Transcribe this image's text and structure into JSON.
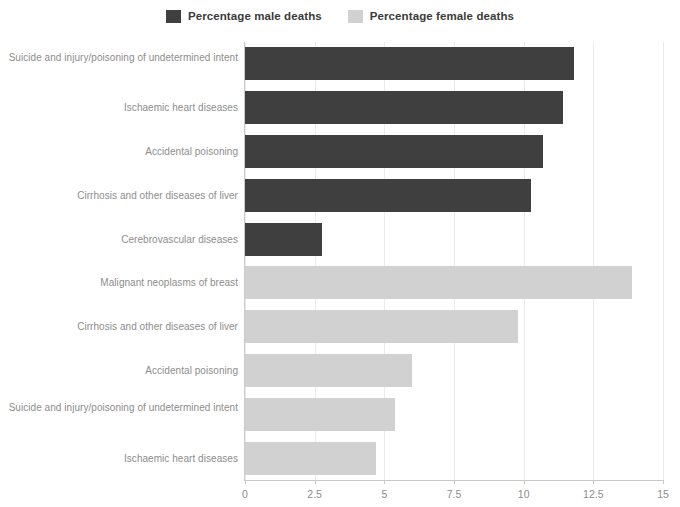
{
  "legend": {
    "entries": [
      {
        "label": "Percentage male deaths",
        "color": "#3f3f3f",
        "key": "male"
      },
      {
        "label": "Percentage female deaths",
        "color": "#d1d1d1",
        "key": "female"
      }
    ]
  },
  "axis": {
    "x_ticks": [
      "0",
      "2.5",
      "5",
      "7.5",
      "10",
      "12.5",
      "15"
    ]
  },
  "categories": [
    "Suicide and injury/poisoning of undetermined intent",
    "Ischaemic heart diseases",
    "Accidental poisoning",
    "Cirrhosis and other diseases of liver",
    "Cerebrovascular diseases",
    "Malignant neoplasms of breast",
    "Cirrhosis and other diseases of liver",
    "Accidental poisoning",
    "Suicide and injury/poisoning of undetermined intent",
    "Ischaemic heart diseases"
  ],
  "chart_data": {
    "type": "bar",
    "orientation": "horizontal",
    "title": "",
    "xlabel": "",
    "ylabel": "",
    "xlim": [
      0,
      15
    ],
    "xticks": [
      0,
      2.5,
      5,
      7.5,
      10,
      12.5,
      15
    ],
    "grid": true,
    "legend_position": "top-center",
    "categories": [
      "Suicide and injury/poisoning of undetermined intent",
      "Ischaemic heart diseases",
      "Accidental poisoning",
      "Cirrhosis and other diseases of liver",
      "Cerebrovascular diseases",
      "Malignant neoplasms of breast",
      "Cirrhosis and other diseases of liver",
      "Accidental poisoning",
      "Suicide and injury/poisoning of undetermined intent",
      "Ischaemic heart diseases"
    ],
    "series": [
      {
        "name": "Percentage male deaths",
        "color": "#3f3f3f",
        "values": [
          11.8,
          11.4,
          10.7,
          10.25,
          2.75,
          null,
          null,
          null,
          null,
          null
        ]
      },
      {
        "name": "Percentage female deaths",
        "color": "#d1d1d1",
        "values": [
          null,
          null,
          null,
          null,
          null,
          13.9,
          9.8,
          6.0,
          5.4,
          4.7
        ]
      }
    ],
    "bars": [
      {
        "category": "Suicide and injury/poisoning of undetermined intent",
        "series": "Percentage male deaths",
        "value": 11.8
      },
      {
        "category": "Ischaemic heart diseases",
        "series": "Percentage male deaths",
        "value": 11.4
      },
      {
        "category": "Accidental poisoning",
        "series": "Percentage male deaths",
        "value": 10.7
      },
      {
        "category": "Cirrhosis and other diseases of liver",
        "series": "Percentage male deaths",
        "value": 10.25
      },
      {
        "category": "Cerebrovascular diseases",
        "series": "Percentage male deaths",
        "value": 2.75
      },
      {
        "category": "Malignant neoplasms of breast",
        "series": "Percentage female deaths",
        "value": 13.9
      },
      {
        "category": "Cirrhosis and other diseases of liver",
        "series": "Percentage female deaths",
        "value": 9.8
      },
      {
        "category": "Accidental poisoning",
        "series": "Percentage female deaths",
        "value": 6.0
      },
      {
        "category": "Suicide and injury/poisoning of undetermined intent",
        "series": "Percentage female deaths",
        "value": 5.4
      },
      {
        "category": "Ischaemic heart diseases",
        "series": "Percentage female deaths",
        "value": 4.7
      }
    ]
  }
}
